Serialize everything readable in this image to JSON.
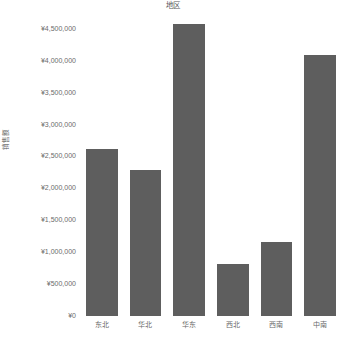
{
  "chart_data": {
    "type": "bar",
    "title": "地区",
    "xlabel": "",
    "ylabel": "销售额",
    "categories": [
      "东北",
      "华北",
      "华东",
      "西北",
      "西南",
      "中南"
    ],
    "values": [
      2620000,
      2285000,
      4570000,
      815000,
      1165000,
      4090000
    ],
    "ylim": [
      0,
      4700000
    ],
    "ytick_values": [
      0,
      500000,
      1000000,
      1500000,
      2000000,
      2500000,
      3000000,
      3500000,
      4000000,
      4500000
    ],
    "ytick_labels": [
      "¥0",
      "¥500,000",
      "¥1,000,000",
      "¥1,500,000",
      "¥2,000,000",
      "¥2,500,000",
      "¥3,000,000",
      "¥3,500,000",
      "¥4,000,000",
      "¥4,500,000"
    ],
    "grid": false,
    "legend": false,
    "bar_color": "#5e5e5e",
    "background_color": "#ffffff",
    "text_color": "#6b6b6b"
  }
}
